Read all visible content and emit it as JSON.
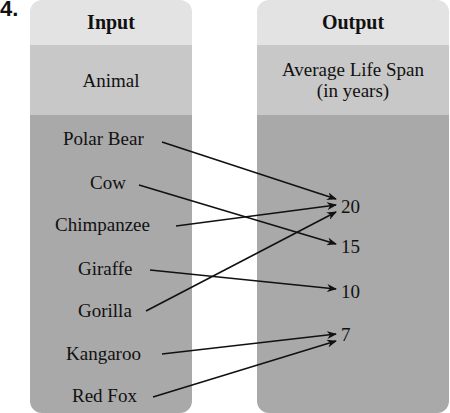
{
  "problem_number": "4.",
  "input": {
    "header": "Input",
    "subheader": "Animal",
    "items": [
      "Polar Bear",
      "Cow",
      "Chimpanzee",
      "Giraffe",
      "Gorilla",
      "Kangaroo",
      "Red Fox"
    ]
  },
  "output": {
    "header": "Output",
    "subheader_line1": "Average Life Span",
    "subheader_line2": "(in years)",
    "values": [
      "20",
      "15",
      "10",
      "7"
    ]
  },
  "mapping": [
    {
      "from": "Polar Bear",
      "to": "20"
    },
    {
      "from": "Cow",
      "to": "15"
    },
    {
      "from": "Chimpanzee",
      "to": "20"
    },
    {
      "from": "Giraffe",
      "to": "10"
    },
    {
      "from": "Gorilla",
      "to": "20"
    },
    {
      "from": "Kangaroo",
      "to": "7"
    },
    {
      "from": "Red Fox",
      "to": "7"
    }
  ]
}
